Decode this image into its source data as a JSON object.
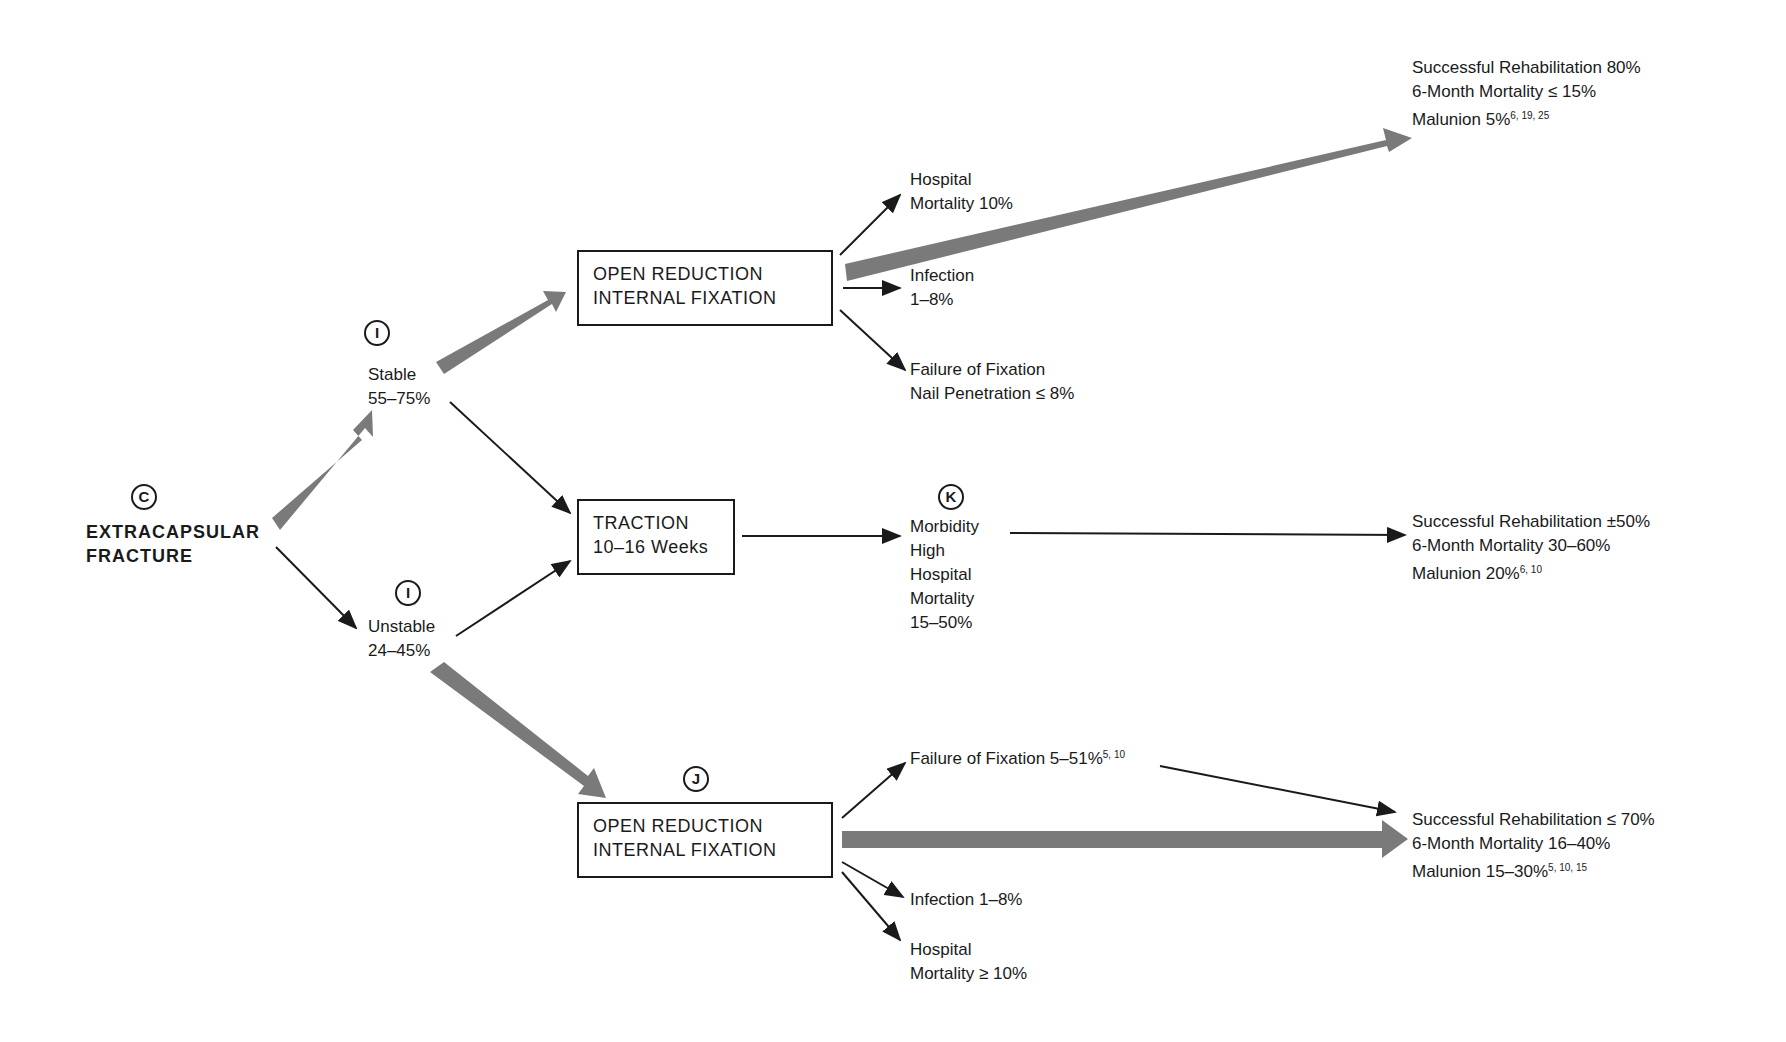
{
  "root": {
    "marker": "C",
    "line1": "EXTRACAPSULAR",
    "line2": "FRACTURE"
  },
  "stable": {
    "marker": "I",
    "label": "Stable",
    "pct": "55–75%"
  },
  "unstable": {
    "marker": "I",
    "label": "Unstable",
    "pct": "24–45%"
  },
  "orif_top": {
    "line1": "OPEN REDUCTION",
    "line2": "INTERNAL FIXATION",
    "complications": [
      {
        "line1": "Hospital",
        "line2": "Mortality 10%"
      },
      {
        "line1": "Infection",
        "line2": "1–8%"
      },
      {
        "line1": "Failure of Fixation",
        "line2": "Nail Penetration ≤ 8%"
      }
    ],
    "outcome": {
      "line1": "Successful Rehabilitation 80%",
      "line2": "6-Month Mortality ≤ 15%",
      "line3": "Malunion 5%",
      "refs": "6, 19, 25"
    }
  },
  "traction": {
    "line1": "TRACTION",
    "line2": "10–16 Weeks",
    "marker": "K",
    "morbidity": [
      "Morbidity",
      "High",
      "Hospital",
      "Mortality",
      "15–50%"
    ],
    "outcome": {
      "line1": "Successful Rehabilitation ±50%",
      "line2": "6-Month Mortality 30–60%",
      "line3": "Malunion 20%",
      "refs": "6, 10"
    }
  },
  "orif_bottom": {
    "marker": "J",
    "line1": "OPEN REDUCTION",
    "line2": "INTERNAL FIXATION",
    "failure": {
      "text": "Failure of Fixation 5–51%",
      "refs": "5, 10"
    },
    "infection": "Infection 1–8%",
    "mortality": {
      "line1": "Hospital",
      "line2": "Mortality ≥ 10%"
    },
    "outcome": {
      "line1": "Successful Rehabilitation ≤ 70%",
      "line2": "6-Month Mortality 16–40%",
      "line3": "Malunion 15–30%",
      "refs": "5, 10, 15"
    }
  },
  "colors": {
    "primary_path": "#7a7a7a",
    "line": "#1a1a1a"
  }
}
